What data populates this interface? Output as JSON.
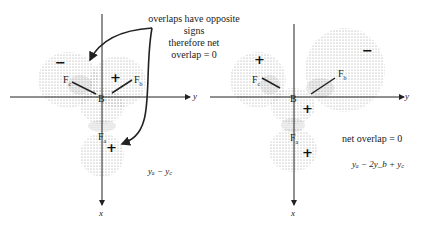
{
  "left_diagram": {
    "annotation": [
      "overlaps have opposite",
      "signs",
      "therefore net",
      "overlap = 0"
    ],
    "atoms": {
      "center": "B",
      "f_c": {
        "base": "F",
        "sub": "c"
      },
      "f_b": {
        "base": "F",
        "sub": "b"
      },
      "f_a": {
        "base": "F",
        "sub": "a"
      }
    },
    "signs": {
      "f_c_lobe": "−",
      "f_b_lobe": "+",
      "f_a_lobe": "+"
    },
    "axes": {
      "horizontal": "y",
      "vertical": "x"
    },
    "equation": "yₐ − y꜀"
  },
  "right_diagram": {
    "annotation": "net overlap = 0",
    "atoms": {
      "center": "B",
      "f_c": {
        "base": "F",
        "sub": "c"
      },
      "f_b": {
        "base": "F",
        "sub": "b"
      },
      "f_a": {
        "base": "F",
        "sub": "a"
      }
    },
    "signs": {
      "f_c_lobe": "+",
      "f_b_lobe": "−",
      "center_lobe": "+",
      "f_a_lobe": "+"
    },
    "axes": {
      "horizontal": "y",
      "vertical": "x"
    },
    "equation": "yₐ − 2y_b + y꜀"
  },
  "colors": {
    "ink": "#222222",
    "stipple": "#8a8a8a",
    "background": "#ffffff"
  }
}
